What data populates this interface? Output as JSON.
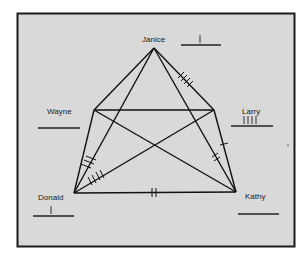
{
  "diagram": {
    "type": "sociogram",
    "background": "#d9d9d9",
    "frame_color": "#1a1a1a",
    "line_color": "#111111",
    "nodes": [
      {
        "id": "janice",
        "label": "Janice",
        "x": 154,
        "y": 48,
        "tally": "|",
        "tally_count": 1
      },
      {
        "id": "wayne",
        "label": "Wayne",
        "x": 94,
        "y": 110,
        "tally": "",
        "tally_count": 0
      },
      {
        "id": "larry",
        "label": "Larry",
        "x": 214,
        "y": 110,
        "tally": "||||",
        "tally_count": 4
      },
      {
        "id": "donald",
        "label": "Donald",
        "x": 74,
        "y": 193,
        "tally": "|",
        "tally_count": 1
      },
      {
        "id": "kathy",
        "label": "Kathy",
        "x": 236,
        "y": 192,
        "tally": "",
        "tally_count": 0
      }
    ],
    "edges": [
      {
        "from": "janice",
        "to": "wayne",
        "marks": 0
      },
      {
        "from": "janice",
        "to": "larry",
        "marks": 0
      },
      {
        "from": "janice",
        "to": "donald",
        "marks": 0
      },
      {
        "from": "janice",
        "to": "kathy",
        "marks": 4
      },
      {
        "from": "wayne",
        "to": "larry",
        "marks": 0
      },
      {
        "from": "wayne",
        "to": "donald",
        "marks": 0
      },
      {
        "from": "wayne",
        "to": "kathy",
        "marks": 2
      },
      {
        "from": "larry",
        "to": "kathy",
        "marks": 1
      },
      {
        "from": "larry",
        "to": "donald",
        "marks": 4
      },
      {
        "from": "donald",
        "to": "kathy",
        "marks": 2
      },
      {
        "from": "donald",
        "to": "janice",
        "marks": 3
      }
    ]
  },
  "labels": {
    "janice": "Janice",
    "wayne": "Wayne",
    "larry": "Larry",
    "donald": "Donald",
    "kathy": "Kathy",
    "janice_tally": "|",
    "larry_tally": "||||",
    "donald_tally": "|"
  }
}
